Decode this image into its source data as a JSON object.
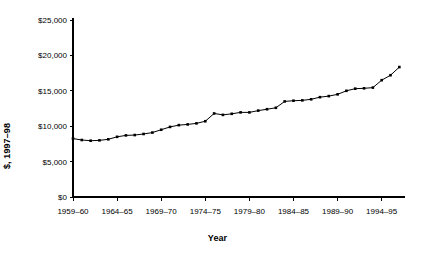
{
  "chart_data": {
    "type": "line",
    "title": "",
    "xlabel": "Year",
    "ylabel": "$, 1997–98",
    "ylim": [
      0,
      25000
    ],
    "grid": false,
    "legend": "none",
    "y_ticks": [
      0,
      5000,
      10000,
      15000,
      20000,
      25000
    ],
    "y_tick_labels": [
      "$0",
      "$5,000",
      "$10,000",
      "$15,000",
      "$20,000",
      "$25,000"
    ],
    "x_tick_labels": [
      "1959–60",
      "1964–65",
      "1969–70",
      "1974–75",
      "1979–80",
      "1984–85",
      "1989–90",
      "1994–95"
    ],
    "x_tick_indices": [
      0,
      5,
      10,
      15,
      20,
      25,
      30,
      35
    ],
    "categories": [
      "1959–60",
      "1960–61",
      "1961–62",
      "1962–63",
      "1963–64",
      "1964–65",
      "1965–66",
      "1966–67",
      "1967–68",
      "1968–69",
      "1969–70",
      "1970–71",
      "1971–72",
      "1972–73",
      "1973–74",
      "1974–75",
      "1975–76",
      "1976–77",
      "1977–78",
      "1978–79",
      "1979–80",
      "1980–81",
      "1981–82",
      "1982–83",
      "1983–84",
      "1984–85",
      "1985–86",
      "1986–87",
      "1987–88",
      "1988–89",
      "1989–90",
      "1990–91",
      "1991–92",
      "1992–93",
      "1993–94",
      "1994–95",
      "1995–96",
      "1996–97"
    ],
    "values": [
      8250,
      8050,
      7950,
      8000,
      8150,
      8500,
      8700,
      8750,
      8900,
      9100,
      9500,
      9900,
      10150,
      10250,
      10400,
      10700,
      11800,
      11600,
      11750,
      11950,
      11950,
      12200,
      12400,
      12600,
      13500,
      13600,
      13650,
      13800,
      14100,
      14250,
      14500,
      15000,
      15300,
      15350,
      15450,
      16500,
      17200,
      18350
    ],
    "marker": "square",
    "series_color": "#000000",
    "background_color": "#ffffff"
  },
  "axis_titles": {
    "x": "Year",
    "y": "$, 1997–98"
  }
}
